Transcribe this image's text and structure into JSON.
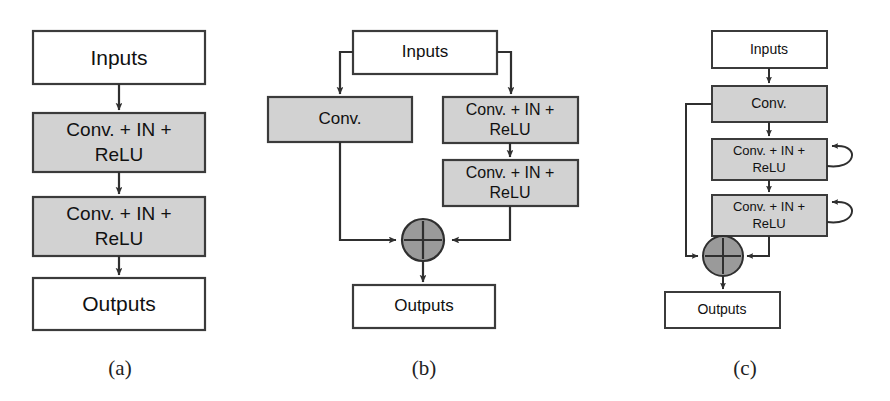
{
  "figure": {
    "type": "diagram",
    "colors": {
      "background": "#ffffff",
      "box_fill_white": "#ffffff",
      "box_fill_gray": "#d2d2d2",
      "box_stroke": "#3b3b3b",
      "circle_fill": "#9a9a9a",
      "arrow": "#2f2f2f",
      "text": "#111111"
    }
  },
  "labels": {
    "inputs": "Inputs",
    "outputs": "Outputs",
    "conv": "Conv.",
    "conv_in_relu_line1": "Conv. + IN +",
    "conv_in_relu_line2": "ReLU",
    "panel_a": "(a)",
    "panel_b": "(b)",
    "panel_c": "(c)"
  },
  "panels": [
    {
      "id": "a",
      "caption": "(a)",
      "nodes": [
        {
          "name": "inputs-box",
          "label": "Inputs",
          "fill": "white",
          "x": 33,
          "y": 31,
          "w": 172,
          "h": 53
        },
        {
          "name": "conv-in-relu-box-1",
          "label": "Conv. + IN + ReLU",
          "fill": "gray",
          "x": 33,
          "y": 113,
          "w": 172,
          "h": 59
        },
        {
          "name": "conv-in-relu-box-2",
          "label": "Conv. + IN + ReLU",
          "fill": "gray",
          "x": 33,
          "y": 197,
          "w": 172,
          "h": 59
        },
        {
          "name": "outputs-box",
          "label": "Outputs",
          "fill": "white",
          "x": 33,
          "y": 278,
          "w": 172,
          "h": 52
        }
      ],
      "edges": [
        {
          "from": "inputs-box",
          "to": "conv-in-relu-box-1"
        },
        {
          "from": "conv-in-relu-box-1",
          "to": "conv-in-relu-box-2"
        },
        {
          "from": "conv-in-relu-box-2",
          "to": "outputs-box"
        }
      ]
    },
    {
      "id": "b",
      "caption": "(b)",
      "nodes": [
        {
          "name": "inputs-box",
          "label": "Inputs",
          "fill": "white",
          "x": 353,
          "y": 31,
          "w": 144,
          "h": 43
        },
        {
          "name": "conv-box",
          "label": "Conv.",
          "fill": "gray",
          "x": 268,
          "y": 97,
          "w": 144,
          "h": 45
        },
        {
          "name": "conv-in-relu-box-1",
          "label": "Conv. + IN + ReLU",
          "fill": "gray",
          "x": 443,
          "y": 97,
          "w": 135,
          "h": 46
        },
        {
          "name": "conv-in-relu-box-2",
          "label": "Conv. + IN + ReLU",
          "fill": "gray",
          "x": 443,
          "y": 160,
          "w": 135,
          "h": 46
        },
        {
          "name": "sum-node",
          "label": "+",
          "fill": "circle",
          "cx": 423,
          "cy": 240,
          "r": 21
        },
        {
          "name": "outputs-box",
          "label": "Outputs",
          "fill": "white",
          "x": 353,
          "y": 285,
          "w": 142,
          "h": 43
        }
      ],
      "edges": [
        {
          "from": "inputs-box",
          "to": "conv-box",
          "style": "branch-left"
        },
        {
          "from": "inputs-box",
          "to": "conv-in-relu-box-1",
          "style": "branch-right"
        },
        {
          "from": "conv-in-relu-box-1",
          "to": "conv-in-relu-box-2"
        },
        {
          "from": "conv-box",
          "to": "sum-node",
          "style": "elbow"
        },
        {
          "from": "conv-in-relu-box-2",
          "to": "sum-node",
          "style": "elbow"
        },
        {
          "from": "sum-node",
          "to": "outputs-box"
        }
      ]
    },
    {
      "id": "c",
      "caption": "(c)",
      "nodes": [
        {
          "name": "inputs-box",
          "label": "Inputs",
          "fill": "white",
          "x": 712,
          "y": 31,
          "w": 115,
          "h": 37
        },
        {
          "name": "conv-box",
          "label": "Conv.",
          "fill": "gray",
          "x": 712,
          "y": 86,
          "w": 115,
          "h": 36
        },
        {
          "name": "conv-in-relu-box-1",
          "label": "Conv. + IN + ReLU",
          "fill": "gray",
          "x": 712,
          "y": 139,
          "w": 115,
          "h": 41
        },
        {
          "name": "conv-in-relu-box-2",
          "label": "Conv. + IN + ReLU",
          "fill": "gray",
          "x": 712,
          "y": 195,
          "w": 115,
          "h": 41
        },
        {
          "name": "sum-node",
          "label": "+",
          "fill": "circle",
          "cx": 723,
          "cy": 256,
          "r": 20
        },
        {
          "name": "outputs-box",
          "label": "Outputs",
          "fill": "white",
          "x": 665,
          "y": 292,
          "w": 115,
          "h": 36
        }
      ],
      "edges": [
        {
          "from": "inputs-box",
          "to": "conv-box"
        },
        {
          "from": "conv-box",
          "to": "conv-in-relu-box-1"
        },
        {
          "from": "conv-in-relu-box-1",
          "to": "conv-in-relu-box-2"
        },
        {
          "from": "conv-in-relu-box-2",
          "to": "sum-node"
        },
        {
          "from": "conv-box",
          "to": "sum-node",
          "style": "skip-left"
        },
        {
          "from": "sum-node",
          "to": "outputs-box"
        },
        {
          "from": "conv-in-relu-box-1",
          "to": "conv-in-relu-box-1",
          "style": "self-loop"
        },
        {
          "from": "conv-in-relu-box-2",
          "to": "conv-in-relu-box-2",
          "style": "self-loop"
        }
      ]
    }
  ]
}
